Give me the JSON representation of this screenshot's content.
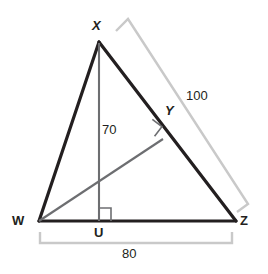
{
  "figure": {
    "kind": "triangle-geometry-diagram",
    "colors": {
      "stroke_primary": "#231f20",
      "stroke_secondary": "#6d6e71",
      "stroke_measure": "#c9c9c9",
      "background": "#ffffff",
      "text": "#231f20"
    },
    "vertices": [
      {
        "name": "vertex-label-x",
        "label": "X",
        "style": "italic",
        "x": 99,
        "y": 42
      },
      {
        "name": "vertex-label-y",
        "label": "Y",
        "style": "italic",
        "x": 162,
        "y": 135
      },
      {
        "name": "vertex-label-w",
        "label": "W",
        "style": "upright",
        "x": 39,
        "y": 221
      },
      {
        "name": "vertex-label-u",
        "label": "U",
        "style": "upright",
        "x": 99,
        "y": 221
      },
      {
        "name": "vertex-label-z",
        "label": "Z",
        "style": "upright",
        "x": 236,
        "y": 221
      }
    ],
    "segments": [
      {
        "name": "segment-wx",
        "from": "W",
        "to": "X",
        "color": "primary",
        "width": 3
      },
      {
        "name": "segment-xz",
        "from": "X",
        "to": "Z",
        "color": "primary",
        "width": 3
      },
      {
        "name": "segment-wz",
        "from": "W",
        "to": "Z",
        "color": "primary",
        "width": 3
      },
      {
        "name": "segment-xu-altitude",
        "from": "X",
        "to": "U",
        "color": "secondary",
        "width": 2
      },
      {
        "name": "segment-wy-altitude",
        "from": "W",
        "to": "Y",
        "color": "secondary",
        "width": 2
      }
    ],
    "right_angles": [
      {
        "name": "right-angle-mark-u",
        "at": "U",
        "rotation_deg": 0
      },
      {
        "name": "right-angle-mark-y",
        "at": "Y",
        "rotation_deg": -35
      }
    ],
    "measures": [
      {
        "name": "measure-label-xz",
        "value": "100",
        "applies_to": "XZ",
        "bracket": "outer-right"
      },
      {
        "name": "measure-label-xu",
        "value": "70",
        "applies_to": "XU",
        "bracket": "none"
      },
      {
        "name": "measure-label-wz",
        "value": "80",
        "applies_to": "WZ",
        "bracket": "bottom"
      }
    ]
  }
}
